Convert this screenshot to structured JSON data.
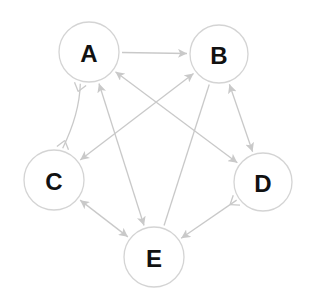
{
  "diagram": {
    "type": "directed-graph",
    "colors": {
      "edge": "#c9c9c9",
      "node_stroke": "#d4d4d4",
      "node_fill": "#ffffff",
      "label": "#111111",
      "background": "#ffffff"
    },
    "nodes": [
      {
        "id": "A",
        "label": "A",
        "cx": 89,
        "cy": 52,
        "r": 30
      },
      {
        "id": "B",
        "label": "B",
        "cx": 219,
        "cy": 54,
        "r": 29
      },
      {
        "id": "C",
        "label": "C",
        "cx": 54,
        "cy": 180,
        "r": 30
      },
      {
        "id": "D",
        "label": "D",
        "cx": 263,
        "cy": 182,
        "r": 29
      },
      {
        "id": "E",
        "label": "E",
        "cx": 154,
        "cy": 257,
        "r": 30
      }
    ],
    "edges": [
      {
        "from": "A",
        "to": "B",
        "start": "none",
        "end": "arrow"
      },
      {
        "from": "A",
        "to": "D",
        "start": "arrow",
        "end": "arrow"
      },
      {
        "from": "A",
        "to": "E",
        "start": "arrow",
        "end": "arrow"
      },
      {
        "from": "A",
        "to": "C",
        "start": "fork",
        "end": "fork",
        "curved": true
      },
      {
        "from": "B",
        "to": "C",
        "start": "arrow",
        "end": "arrow"
      },
      {
        "from": "B",
        "to": "D",
        "start": "arrow",
        "end": "arrow"
      },
      {
        "from": "B",
        "to": "E",
        "start": "none",
        "end": "none"
      },
      {
        "from": "C",
        "to": "E",
        "start": "arrow",
        "end": "arrow"
      },
      {
        "from": "D",
        "to": "E",
        "start": "fork",
        "end": "arrow"
      }
    ]
  }
}
